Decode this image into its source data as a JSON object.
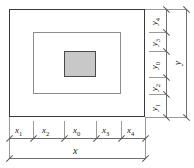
{
  "diagram": {
    "shapes": {
      "outer_rect": "outer-boundary-rectangle",
      "middle_rect": "middle-boundary-rectangle",
      "inner_rect": "inner-filled-rectangle"
    },
    "colors": {
      "outer_border": "#3a3a3a",
      "middle_border": "#8d8d8d",
      "inner_border": "#4a4a4a",
      "inner_fill": "#c8c8c8",
      "dimension_line": "#6f6f6f",
      "extension_line": "#9a9a9a",
      "background": "#ffffff"
    },
    "horizontal_dimensions": {
      "segments": [
        {
          "base": "x",
          "sub": "1"
        },
        {
          "base": "x",
          "sub": "2"
        },
        {
          "base": "x",
          "sub": "0"
        },
        {
          "base": "x",
          "sub": "3"
        },
        {
          "base": "x",
          "sub": "4"
        }
      ],
      "total": {
        "base": "x",
        "sub": ""
      }
    },
    "vertical_dimensions": {
      "segments_bottom_to_top": [
        {
          "base": "y",
          "sub": "1"
        },
        {
          "base": "y",
          "sub": "2"
        },
        {
          "base": "y",
          "sub": "0"
        },
        {
          "base": "y",
          "sub": "3"
        },
        {
          "base": "y",
          "sub": "4"
        }
      ],
      "total": {
        "base": "y",
        "sub": ""
      }
    }
  }
}
